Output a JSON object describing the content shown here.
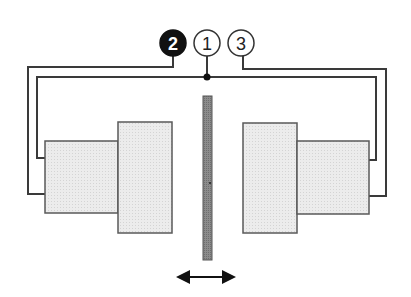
{
  "diagram": {
    "type": "schematic",
    "colors": {
      "background": "#ffffff",
      "line": "#3a3a3a",
      "block_fill": "#ebebeb",
      "block_stroke": "#5a5a5a",
      "plate_fill": "#8a8a8a",
      "plate_stroke": "#555555",
      "label_filled_bg": "#111111",
      "label_filled_text": "#ffffff",
      "label_outline_bg": "#ffffff",
      "label_outline_text": "#222222"
    },
    "labels": [
      {
        "id": "2",
        "text": "2",
        "style": "filled",
        "cx": 173,
        "cy": 43
      },
      {
        "id": "1",
        "text": "1",
        "style": "outline",
        "cx": 207,
        "cy": 43
      },
      {
        "id": "3",
        "text": "3",
        "style": "outline",
        "cx": 241,
        "cy": 43
      }
    ],
    "blocks": {
      "left_outer": {
        "x": 45,
        "y": 141,
        "w": 73,
        "h": 72
      },
      "left_inner": {
        "x": 118,
        "y": 122,
        "w": 54,
        "h": 111
      },
      "right_inner": {
        "x": 243,
        "y": 123,
        "w": 54,
        "h": 110
      },
      "right_outer": {
        "x": 297,
        "y": 141,
        "w": 72,
        "h": 73
      }
    },
    "center_plate": {
      "x": 203,
      "y": 96,
      "w": 9,
      "h": 164
    },
    "motion_arrow": {
      "x1": 176,
      "x2": 236,
      "y": 277,
      "direction": "bidirectional-horizontal"
    }
  }
}
